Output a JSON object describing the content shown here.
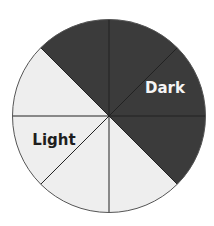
{
  "chart_data": {
    "type": "pie",
    "title": "",
    "slices": [
      {
        "label": "Dark",
        "segments": 4,
        "fraction": 0.5,
        "color": "#3b3b3b"
      },
      {
        "label": "Light",
        "segments": 4,
        "fraction": 0.5,
        "color": "#eeeeee"
      }
    ],
    "categories": [
      "Dark",
      "Light"
    ],
    "values": [
      4,
      4
    ],
    "total_segments": 8,
    "segment_angle_deg": 45,
    "dark_segments_start_deg": -45,
    "light_segments_start_deg": 135
  },
  "labels": {
    "dark": "Dark",
    "light": "Light"
  },
  "colors": {
    "dark_fill": "#3b3b3b",
    "light_fill": "#eeeeee",
    "divider": "#222222",
    "outline": "#555555",
    "dark_text": "#f5f5f5",
    "light_text": "#1e1e1e"
  }
}
